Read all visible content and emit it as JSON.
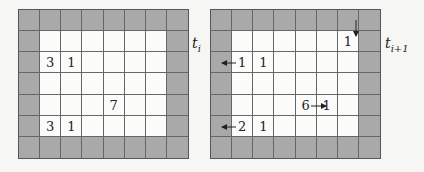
{
  "left": {
    "label": "t",
    "label_sub": "i",
    "numbers": [
      {
        "row": 2,
        "col": 1,
        "value": "3"
      },
      {
        "row": 2,
        "col": 2,
        "value": "1"
      },
      {
        "row": 4,
        "col": 4,
        "value": "7"
      },
      {
        "row": 5,
        "col": 1,
        "value": "3"
      },
      {
        "row": 5,
        "col": 2,
        "value": "1"
      }
    ]
  },
  "right": {
    "label": "t",
    "label_sub": "i+1",
    "numbers": [
      {
        "row": 1,
        "col": 6,
        "value": "1",
        "arrow": "down-in"
      },
      {
        "row": 2,
        "col": 1,
        "value": "1",
        "arrow": "left"
      },
      {
        "row": 2,
        "col": 2,
        "value": "1"
      },
      {
        "row": 4,
        "col": 4,
        "value": "6"
      },
      {
        "row": 4,
        "col": 5,
        "value": "1",
        "arrow": "right-in"
      },
      {
        "row": 5,
        "col": 1,
        "value": "2",
        "arrow": "left"
      },
      {
        "row": 5,
        "col": 2,
        "value": "1"
      }
    ]
  },
  "grid": {
    "cols": 8,
    "rows": 7
  },
  "colors": {
    "wall": "#a9a9a9",
    "floor": "#fbfbfa",
    "line": "#666666"
  }
}
